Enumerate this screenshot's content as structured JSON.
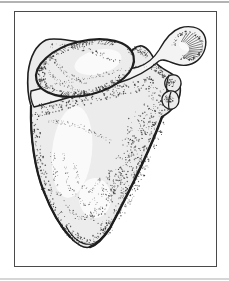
{
  "figure": {
    "alt": "Stippled pen-and-ink anatomical illustration of a human scapula (shoulder blade), posterior view, inside a rectangular frame"
  },
  "colors": {
    "page_bg": "#ffffff",
    "top_rule": "#b3b3b3",
    "bottom_rule": "#d6d6d6",
    "frame_border": "#4a4a4a",
    "panel_bg": "#ffffff",
    "ink": "#1f1f1f",
    "bone": "#ececec",
    "bone_light": "#f3f3f3",
    "highlight": "#fafafa"
  }
}
